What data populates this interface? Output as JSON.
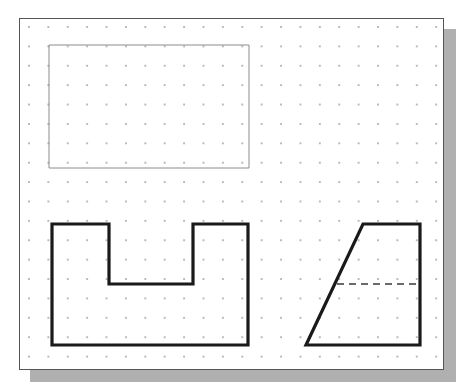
{
  "document": {
    "title": "Engineering Drawing Sheet",
    "sheet_background": "#ffffff",
    "page_background": "#ffffff",
    "shadow_color": "#b0b0b0",
    "border_color": "#555555"
  },
  "grid": {
    "name": "dot-grid",
    "dot_color": "#b9b9b9",
    "spacing_px": 19.4,
    "visible": true
  },
  "figures": [
    {
      "id": "figure-1",
      "name": "plain-rectangle",
      "label": "",
      "type": "rectangle",
      "stroke_color": "#8c8c8c",
      "stroke_width": 1,
      "line_style": "solid",
      "points": [
        [
          29,
          26
        ],
        [
          229,
          26
        ],
        [
          229,
          149
        ],
        [
          29,
          149
        ]
      ]
    },
    {
      "id": "figure-2",
      "name": "u-channel-profile",
      "label": "",
      "type": "polygon",
      "stroke_color": "#1a1a1a",
      "stroke_width": 3.2,
      "line_style": "solid",
      "points": [
        [
          32,
          205
        ],
        [
          89,
          205
        ],
        [
          89,
          265
        ],
        [
          173,
          265
        ],
        [
          173,
          205
        ],
        [
          228,
          205
        ],
        [
          228,
          326
        ],
        [
          32,
          326
        ]
      ]
    },
    {
      "id": "figure-3",
      "name": "trapezoid-profile",
      "label": "",
      "type": "polygon",
      "stroke_color": "#1a1a1a",
      "stroke_width": 3.2,
      "line_style": "solid",
      "points": [
        [
          343,
          205
        ],
        [
          400,
          205
        ],
        [
          400,
          326
        ],
        [
          286,
          326
        ]
      ]
    },
    {
      "id": "figure-3-hidden",
      "name": "trapezoid-hidden-line",
      "label": "",
      "type": "line",
      "stroke_color": "#3a3a3a",
      "stroke_width": 1.6,
      "line_style": "dashed",
      "dash_pattern": "7 5",
      "points": [
        [
          317,
          265
        ],
        [
          400,
          265
        ]
      ]
    }
  ]
}
